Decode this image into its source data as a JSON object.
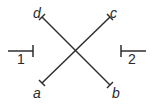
{
  "diagram": {
    "lines": [
      {
        "id": "a-c",
        "from_label": "a",
        "to_label": "c"
      },
      {
        "id": "d-b",
        "from_label": "d",
        "to_label": "b"
      }
    ],
    "segments": [
      {
        "id": "1",
        "label": "1"
      },
      {
        "id": "2",
        "label": "2"
      }
    ],
    "labels": {
      "a": "a",
      "b": "b",
      "c": "c",
      "d": "d",
      "seg1": "1",
      "seg2": "2"
    },
    "colors": {
      "stroke": "#2e2e2e",
      "text": "#2a2a2a",
      "background": "#ffffff"
    }
  }
}
